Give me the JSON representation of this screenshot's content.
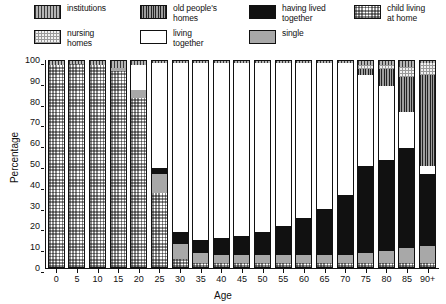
{
  "legend": {
    "items": [
      {
        "key": "institutions",
        "label": "institutions",
        "swatch": "p-institutions",
        "color": "#b5b5b5"
      },
      {
        "key": "old_peoples_homes",
        "label": "old people's\nhomes",
        "swatch": "p-oldhomes",
        "color": "#9e9e9e"
      },
      {
        "key": "having_lived_together",
        "label": "having lived\ntogether",
        "swatch": "p-hadlived",
        "color": "#111111"
      },
      {
        "key": "child_living_at_home",
        "label": "child living\nat home",
        "swatch": "p-child",
        "color": "#8c8c8c"
      },
      {
        "key": "nursing_homes",
        "label": "nursing\nhomes",
        "swatch": "p-nursing",
        "color": "#f2f2f2"
      },
      {
        "key": "living_together",
        "label": "living\ntogether",
        "swatch": "p-livingtog",
        "color": "#ffffff"
      },
      {
        "key": "single",
        "label": "single",
        "swatch": "p-single",
        "color": "#a8a8a8"
      }
    ]
  },
  "chart_data": {
    "type": "bar",
    "stacked": true,
    "title": "",
    "xlabel": "Age",
    "ylabel": "Percentage",
    "ylim": [
      0,
      100
    ],
    "yticks": [
      0,
      10,
      20,
      30,
      40,
      50,
      60,
      70,
      80,
      90,
      100
    ],
    "grid": false,
    "legend_position": "top",
    "categories": [
      "0",
      "5",
      "10",
      "15",
      "20",
      "25",
      "30",
      "35",
      "40",
      "45",
      "50",
      "55",
      "60",
      "65",
      "70",
      "75",
      "80",
      "85",
      "90+"
    ],
    "series": [
      {
        "name": "child living at home",
        "values": [
          98,
          98.5,
          98,
          95,
          82,
          36,
          4,
          2,
          2,
          2,
          2,
          2,
          2,
          2,
          2,
          2,
          2,
          2,
          2
        ]
      },
      {
        "name": "single",
        "values": [
          0,
          0,
          0,
          1.5,
          4,
          9,
          7,
          5,
          4,
          4,
          4,
          4,
          4,
          4,
          4,
          5,
          6,
          7,
          8
        ]
      },
      {
        "name": "having lived together",
        "values": [
          0,
          0,
          0,
          0,
          0,
          3,
          6,
          6,
          8,
          9,
          11,
          14,
          18,
          22,
          29,
          42,
          44,
          49,
          35
        ]
      },
      {
        "name": "living together",
        "values": [
          0,
          0,
          0,
          0,
          12,
          51,
          82,
          86,
          85,
          84,
          82,
          79,
          75,
          71,
          64,
          44,
          36,
          17,
          4
        ]
      },
      {
        "name": "old people's homes",
        "values": [
          0,
          0,
          0,
          0,
          0,
          0,
          0,
          0,
          0,
          0,
          0,
          0,
          0,
          0,
          0,
          3,
          8,
          17,
          44
        ]
      },
      {
        "name": "nursing homes",
        "values": [
          0,
          0,
          0,
          0,
          0,
          0,
          0,
          0,
          0,
          0,
          0,
          0,
          0,
          0,
          0,
          2,
          2,
          5,
          6
        ]
      },
      {
        "name": "institutions",
        "values": [
          2,
          1.5,
          2,
          3.5,
          2,
          1,
          1,
          1,
          1,
          1,
          1,
          1,
          1,
          1,
          1,
          2,
          2,
          3,
          1
        ]
      }
    ]
  }
}
